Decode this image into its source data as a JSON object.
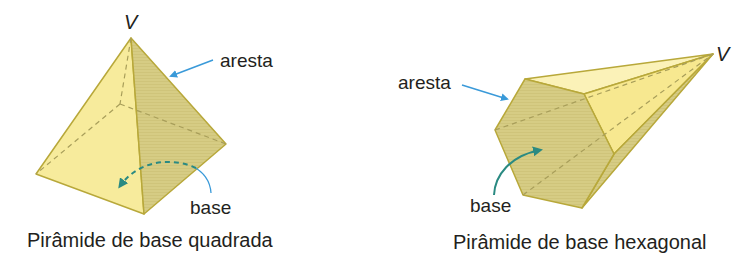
{
  "figures": [
    {
      "id": "square-pyramid",
      "vertex_label": "V",
      "edge_label": "aresta",
      "base_label": "base",
      "caption": "Pirâmide de base quadrada"
    },
    {
      "id": "hexagonal-pyramid",
      "vertex_label": "V",
      "edge_label": "aresta",
      "base_label": "base",
      "caption": "Pirâmide de base hexagonal"
    }
  ],
  "colors": {
    "face_light": "#f7eb9c",
    "face_shaded": "#d9cf86",
    "edge": "#b8a83a",
    "hidden_edge": "#a89e5a",
    "arrow_blue": "#3a9ad9",
    "arrow_teal": "#2a8a82",
    "text": "#231f20"
  }
}
